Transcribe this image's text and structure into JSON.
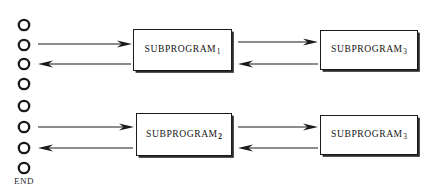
{
  "diagram": {
    "background_color": "#ffffff",
    "stroke_color": "#1a1a1a",
    "end_marker": {
      "label": "END"
    },
    "flow_circles": [
      {
        "name": "circle-1",
        "cx": 24,
        "cy": 25,
        "r": 5.2
      },
      {
        "name": "circle-2",
        "cx": 24,
        "cy": 45,
        "r": 5.2
      },
      {
        "name": "circle-3",
        "cx": 24,
        "cy": 64,
        "r": 5.2
      },
      {
        "name": "circle-4",
        "cx": 24,
        "cy": 84,
        "r": 5.2
      },
      {
        "name": "circle-5",
        "cx": 24,
        "cy": 106,
        "r": 5.2
      },
      {
        "name": "circle-6",
        "cx": 24,
        "cy": 127,
        "r": 5.2
      },
      {
        "name": "circle-7",
        "cx": 24,
        "cy": 148,
        "r": 5.2
      },
      {
        "name": "circle-8",
        "cx": 24,
        "cy": 168,
        "r": 5.2
      }
    ],
    "boxes": [
      {
        "name": "subprogram-1",
        "text": "SUBPROGRAM",
        "subscript": "1",
        "bold_subscript": false,
        "x": 133,
        "y": 29,
        "width": 99,
        "height": 42
      },
      {
        "name": "subprogram-3-top",
        "text": "SUBPROGRAM",
        "subscript": "3",
        "bold_subscript": false,
        "x": 320,
        "y": 30,
        "width": 98,
        "height": 40
      },
      {
        "name": "subprogram-2",
        "text": "SUBPROGRAM",
        "subscript": "2",
        "bold_subscript": true,
        "x": 136,
        "y": 113,
        "width": 96,
        "height": 43
      },
      {
        "name": "subprogram-3-bottom",
        "text": "SUBPROGRAM",
        "subscript": "3",
        "bold_subscript": false,
        "x": 320,
        "y": 115,
        "width": 98,
        "height": 40
      }
    ],
    "arrows": [
      {
        "name": "arrow-main-to-sub1",
        "x1": 38,
        "y1": 44,
        "x2": 132,
        "y2": 44,
        "direction": "right"
      },
      {
        "name": "arrow-sub1-to-main",
        "x1": 131,
        "y1": 64,
        "x2": 38,
        "y2": 64,
        "direction": "left"
      },
      {
        "name": "arrow-sub1-to-sub3-top",
        "x1": 238,
        "y1": 42,
        "x2": 318,
        "y2": 42,
        "direction": "right"
      },
      {
        "name": "arrow-sub3-to-sub1-top",
        "x1": 318,
        "y1": 64,
        "x2": 238,
        "y2": 64,
        "direction": "left"
      },
      {
        "name": "arrow-main-to-sub2",
        "x1": 38,
        "y1": 127,
        "x2": 134,
        "y2": 127,
        "direction": "right"
      },
      {
        "name": "arrow-sub2-to-main",
        "x1": 133,
        "y1": 148,
        "x2": 38,
        "y2": 148,
        "direction": "left"
      },
      {
        "name": "arrow-sub2-to-sub3-bottom",
        "x1": 238,
        "y1": 127,
        "x2": 318,
        "y2": 127,
        "direction": "right"
      },
      {
        "name": "arrow-sub3-to-sub2-bottom",
        "x1": 318,
        "y1": 148,
        "x2": 238,
        "y2": 148,
        "direction": "left"
      }
    ]
  }
}
